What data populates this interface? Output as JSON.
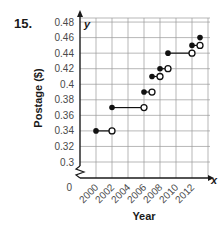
{
  "problem_number": "15.",
  "chart_data": {
    "type": "line",
    "subtype": "step",
    "title": "",
    "xlabel": "Year",
    "ylabel": "Postage ($)",
    "x_axis_letter": "x",
    "y_axis_letter": "y",
    "x_ticks": [
      "2000",
      "2002",
      "2004",
      "2006",
      "2008",
      "2010",
      "2012"
    ],
    "y_ticks": [
      "0.48",
      "0.46",
      "0.44",
      "0.42",
      "0.4",
      "0.38",
      "0.36",
      "0.34",
      "0.32",
      "0.3"
    ],
    "origin_label": "0",
    "axis_break": true,
    "xlim": [
      1998,
      2014
    ],
    "ylim": [
      0.3,
      0.48
    ],
    "grid": true,
    "steps": [
      {
        "x_start": 2000,
        "x_end": 2002,
        "y": 0.34,
        "start": "closed",
        "end": "open"
      },
      {
        "x_start": 2002,
        "x_end": 2006,
        "y": 0.37,
        "start": "closed",
        "end": "open"
      },
      {
        "x_start": 2006,
        "x_end": 2007,
        "y": 0.39,
        "start": "closed",
        "end": "open"
      },
      {
        "x_start": 2007,
        "x_end": 2008,
        "y": 0.41,
        "start": "closed",
        "end": "open"
      },
      {
        "x_start": 2008,
        "x_end": 2009,
        "y": 0.42,
        "start": "closed",
        "end": "open"
      },
      {
        "x_start": 2009,
        "x_end": 2012,
        "y": 0.44,
        "start": "closed",
        "end": "open"
      },
      {
        "x_start": 2012,
        "x_end": 2013,
        "y": 0.45,
        "start": "closed",
        "end": "open"
      },
      {
        "x_start": 2013,
        "x_end": null,
        "y": 0.46,
        "start": "closed",
        "end": null
      }
    ]
  },
  "colors": {
    "axis": "#1a1a1a",
    "grid": "#9a9a9a",
    "point": "#111111",
    "text": "#4a4a4a"
  }
}
